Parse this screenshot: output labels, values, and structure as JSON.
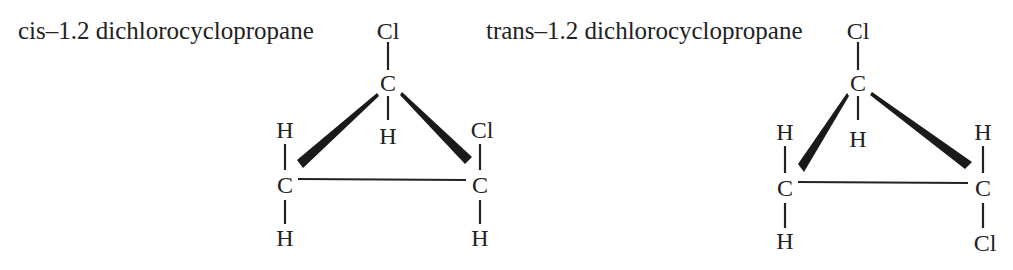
{
  "figure": {
    "molecules": [
      {
        "id": "cis",
        "title": "cis–1.2 dichlorocyclopropane",
        "atoms": {
          "apex_top_substituent": "Cl",
          "apex_carbon": "C",
          "apex_bottom_substituent": "H",
          "left_carbon": "C",
          "left_top_substituent": "H",
          "left_bottom_substituent": "H",
          "right_carbon": "C",
          "right_top_substituent": "Cl",
          "right_bottom_substituent": "H"
        }
      },
      {
        "id": "trans",
        "title": "trans–1.2 dichlorocyclopropane",
        "atoms": {
          "apex_top_substituent": "Cl",
          "apex_carbon": "C",
          "apex_bottom_substituent": "H",
          "left_carbon": "C",
          "left_top_substituent": "H",
          "left_bottom_substituent": "H",
          "right_carbon": "C",
          "right_top_substituent": "H",
          "right_bottom_substituent": "Cl"
        }
      }
    ],
    "colors": {
      "ink": "#222222",
      "background": "#ffffff"
    }
  }
}
